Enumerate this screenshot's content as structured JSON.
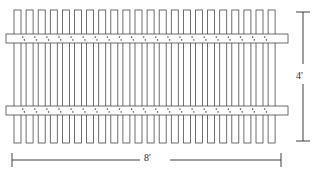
{
  "drawing": {
    "type": "fence-panel-elevation",
    "background_color": "#ffffff",
    "line_color": "#4a4a4a",
    "line_color_dark": "#2b2b2b",
    "fill_color": "#ffffff"
  },
  "dimensions": {
    "height_label": "4'",
    "width_label": "8'"
  },
  "pickets": {
    "count": 22,
    "first_left": 14,
    "pitch": 12.1,
    "width": 7,
    "top": 10,
    "bottom": 143
  },
  "rails": {
    "count": 2,
    "left": 6,
    "right": 288,
    "thickness": 9,
    "top_rail_y": 34,
    "bottom_rail_y": 106,
    "fastener_marks_per_gap": 2
  },
  "dimension_lines": {
    "vertical": {
      "x": 303,
      "top": 12,
      "bottom": 141,
      "tick_half_width": 7,
      "gap_top": 64,
      "gap_bottom": 84
    },
    "horizontal": {
      "y": 160,
      "left": 12,
      "right": 281,
      "tick_half_height": 7,
      "gap_left": 140,
      "gap_right": 170
    }
  }
}
